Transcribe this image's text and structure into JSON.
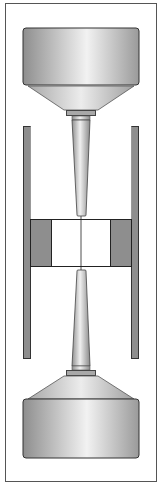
{
  "diagram": {
    "title": "",
    "colors": {
      "background": "#ffffff",
      "border": "#555555",
      "metal_light": "#eeeeee",
      "metal_mid": "#b8b8b8",
      "metal_dark": "#8a8a8a",
      "gasket_gray": "#8e8e8e",
      "outline": "#222222"
    },
    "components": [
      {
        "name": "upper-anvil-body"
      },
      {
        "name": "upper-anvil-cone"
      },
      {
        "name": "upper-collar"
      },
      {
        "name": "upper-tip"
      },
      {
        "name": "left-side-plate"
      },
      {
        "name": "right-side-plate"
      },
      {
        "name": "left-gasket-block"
      },
      {
        "name": "right-gasket-block"
      },
      {
        "name": "sample-chamber"
      },
      {
        "name": "center-axis-line"
      },
      {
        "name": "lower-tip"
      },
      {
        "name": "lower-collar"
      },
      {
        "name": "lower-anvil-cone"
      },
      {
        "name": "lower-anvil-body"
      }
    ]
  }
}
